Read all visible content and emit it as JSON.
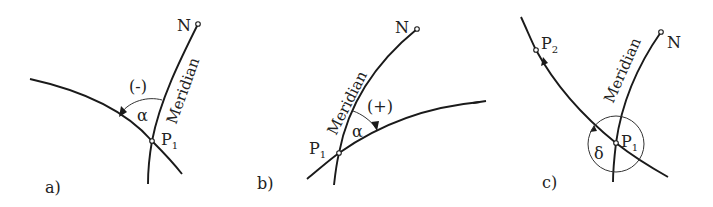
{
  "figure": {
    "panels": [
      {
        "id": "a",
        "label": "a)",
        "north_label": "N",
        "meridian_label": "Meridian",
        "point_label": "P",
        "point_sub": "1",
        "angle_symbol": "α",
        "sign_label": "(-)"
      },
      {
        "id": "b",
        "label": "b)",
        "north_label": "N",
        "meridian_label": "Meridian",
        "point_label": "P",
        "point_sub": "1",
        "angle_symbol": "α",
        "sign_label": "(+)"
      },
      {
        "id": "c",
        "label": "c)",
        "north_label": "N",
        "meridian_label": "Meridian",
        "point_label": "P",
        "point_sub": "1",
        "point2_label": "P",
        "point2_sub": "2",
        "angle_symbol": "δ"
      }
    ]
  }
}
